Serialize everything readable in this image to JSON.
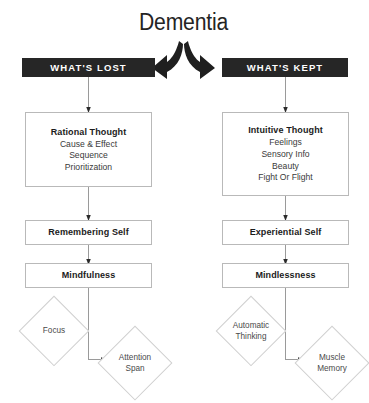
{
  "title": "Dementia",
  "columns": {
    "left": {
      "banner": "WHAT'S LOST",
      "nodes": {
        "thought": {
          "heading": "Rational Thought",
          "lines": [
            "Cause & Effect",
            "Sequence",
            "Prioritization"
          ]
        },
        "self": "Remembering Self",
        "state": "Mindfulness",
        "outcome_a": "Focus",
        "outcome_b": "Attention Span"
      }
    },
    "right": {
      "banner": "WHAT'S KEPT",
      "nodes": {
        "thought": {
          "heading": "Intuitive Thought",
          "lines": [
            "Feelings",
            "Sensory Info",
            "Beauty",
            "Fight Or Flight"
          ]
        },
        "self": "Experiential Self",
        "state": "Mindlessness",
        "outcome_a": "Automatic Thinking",
        "outcome_b": "Muscle Memory"
      }
    }
  },
  "colors": {
    "banner_bg": "#262626",
    "banner_text": "#ffffff",
    "box_border": "#b9b9b9",
    "diamond_border": "#cfcfcf",
    "connector": "#9a9a9a",
    "arrow_glyph": "#1f1f1f",
    "background": "#ffffff"
  },
  "icons": {
    "branch_left": "curved-arrow-left-icon",
    "branch_right": "curved-arrow-right-icon"
  }
}
